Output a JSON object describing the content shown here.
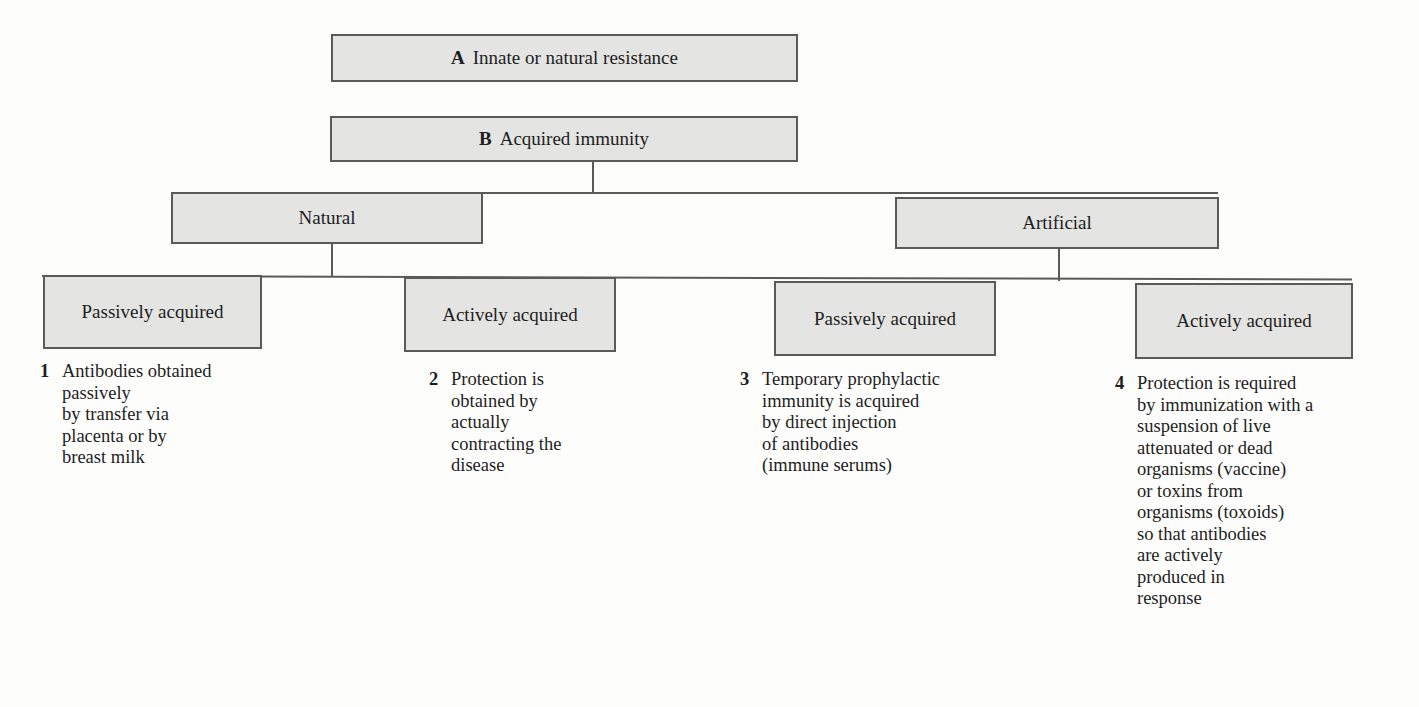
{
  "diagram": {
    "node_a": {
      "letter": "A",
      "label": "Innate or natural resistance"
    },
    "node_b": {
      "letter": "B",
      "label": "Acquired immunity"
    },
    "natural": {
      "label": "Natural"
    },
    "artificial": {
      "label": "Artificial"
    },
    "leaves": [
      {
        "label": "Passively acquired",
        "num": "1",
        "text": "Antibodies obtained\npassively\nby transfer via\nplacenta or by\nbreast milk"
      },
      {
        "label": "Actively acquired",
        "num": "2",
        "text": "Protection is\nobtained by\nactually\ncontracting the\ndisease"
      },
      {
        "label": "Passively acquired",
        "num": "3",
        "text": "Temporary prophylactic\nimmunity is acquired\nby direct injection\nof antibodies\n(immune serums)"
      },
      {
        "label": "Actively acquired",
        "num": "4",
        "text": "Protection is required\nby immunization with a\nsuspension of live\nattenuated or dead\norganisms (vaccine)\nor toxins from\norganisms (toxoids)\nso that antibodies\nare actively\nproduced in\nresponse"
      }
    ]
  }
}
